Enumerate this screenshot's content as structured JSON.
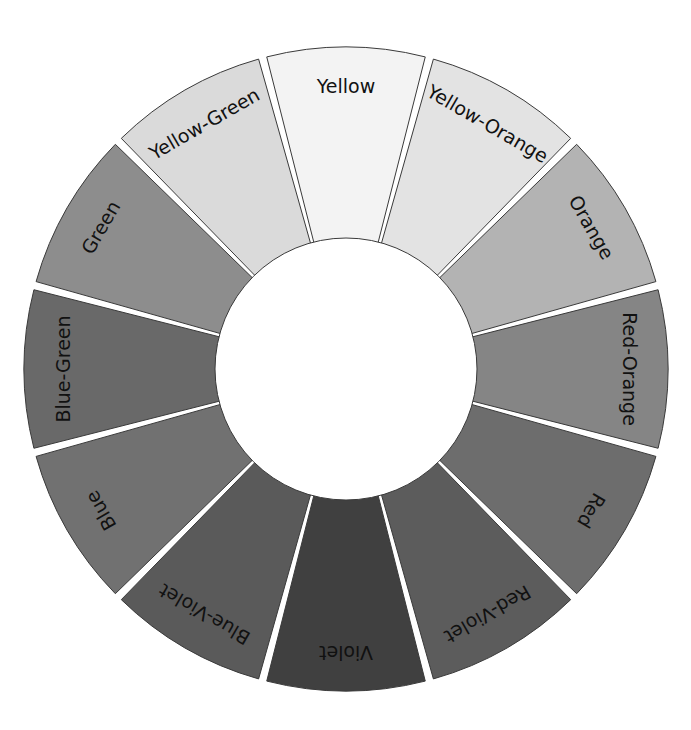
{
  "wheel": {
    "center": [
      346,
      369
    ],
    "outer_radius": 322,
    "inner_radius": 131,
    "label_radius": 282,
    "gap_color": "#ffffff",
    "outline_color": "#3a3a3a",
    "start_angle_deg": -15
  },
  "segments": [
    {
      "label": "Yellow",
      "fill": "#f3f3f3"
    },
    {
      "label": "Yellow-Orange",
      "fill": "#e3e3e3"
    },
    {
      "label": "Orange",
      "fill": "#b3b3b3"
    },
    {
      "label": "Red-Orange",
      "fill": "#858585"
    },
    {
      "label": "Red",
      "fill": "#6d6d6d"
    },
    {
      "label": "Red-Violet",
      "fill": "#5c5c5c"
    },
    {
      "label": "Violet",
      "fill": "#404040"
    },
    {
      "label": "Blue-Violet",
      "fill": "#5a5a5a"
    },
    {
      "label": "Blue",
      "fill": "#717171"
    },
    {
      "label": "Blue-Green",
      "fill": "#696969"
    },
    {
      "label": "Green",
      "fill": "#8d8d8d"
    },
    {
      "label": "Yellow-Green",
      "fill": "#dadada"
    }
  ]
}
